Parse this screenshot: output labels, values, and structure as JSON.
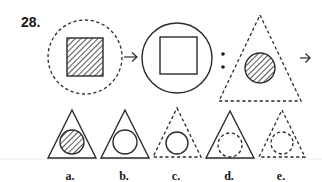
{
  "question": {
    "number": "28.",
    "analogy": {
      "first_pair": {
        "source": {
          "outer": "dashed-circle",
          "inner": "hatched-square"
        },
        "target": {
          "outer": "solid-circle",
          "inner": "empty-solid-square"
        }
      },
      "second_pair": {
        "source": {
          "outer": "dashed-triangle",
          "inner": "hatched-circle"
        },
        "target": "?"
      },
      "separator": ":"
    },
    "options": [
      {
        "label": "a.",
        "outer": "solid-triangle",
        "inner": "hatched-solid-circle"
      },
      {
        "label": "b.",
        "outer": "solid-triangle",
        "inner": "empty-solid-circle"
      },
      {
        "label": "c.",
        "outer": "dashed-triangle",
        "inner": "empty-solid-circle"
      },
      {
        "label": "d.",
        "outer": "solid-triangle",
        "inner": "dashed-circle"
      },
      {
        "label": "e.",
        "outer": "dashed-triangle",
        "inner": "dashed-circle"
      }
    ]
  },
  "colors": {
    "stroke": "#2a2a2a",
    "background": "#ffffff",
    "separator_line": "#e6e6e6"
  }
}
